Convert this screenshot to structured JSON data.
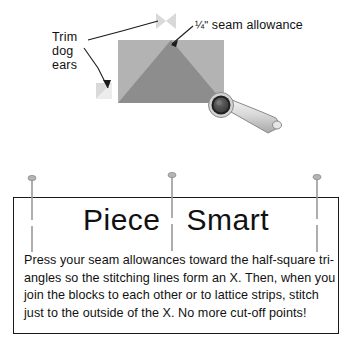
{
  "illustration": {
    "annotations": {
      "trim_label_lines": [
        "Trim",
        "dog",
        "ears"
      ],
      "seam_allowance_fraction": "¼\"",
      "seam_allowance_text": " seam allowance"
    },
    "block": {
      "background_color": "#b3b3b3",
      "triangle_color": "#8c8c8c",
      "dog_ear_color": "#d9d9d9"
    },
    "tool": {
      "name": "rotary-cutter",
      "blade_color": "#4d4d4d",
      "handle_color": "#d0d0d0"
    },
    "leader_line_color": "#1a1a1a"
  },
  "tipbox": {
    "title_words": [
      "Piece",
      "Smart"
    ],
    "body_lines": [
      "Press your seam allowances toward the half-square tri-",
      "angles so the stitching lines form an X. Then, when you",
      "join the blocks to each other or to lattice strips, stitch",
      "just to the outside of the X. No more cut-off points!"
    ],
    "border_color": "#1a1a1a",
    "pin_color": "#9a9a9a",
    "pin_count": 3
  }
}
